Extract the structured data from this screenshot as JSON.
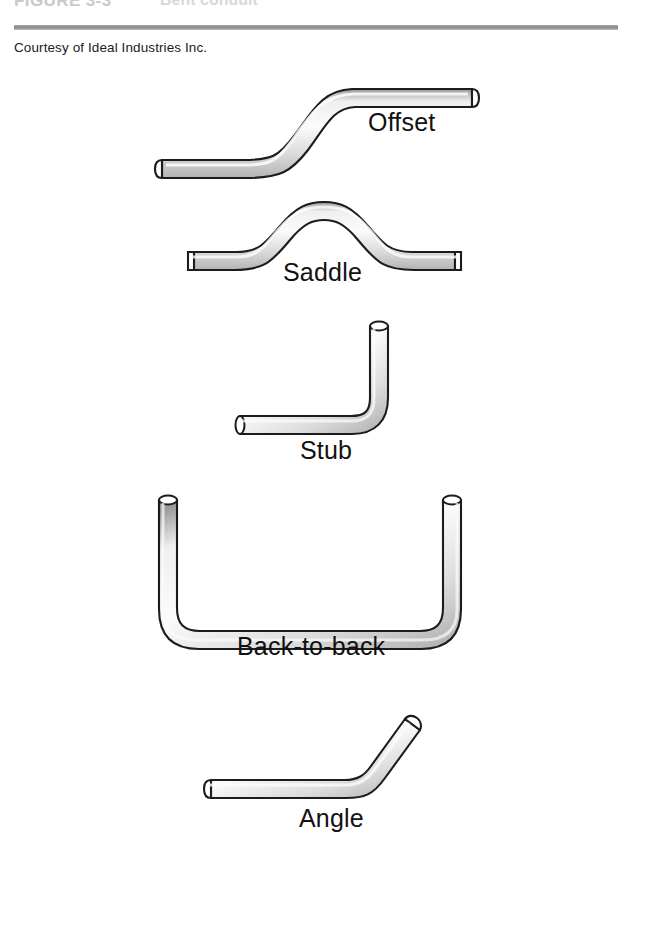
{
  "figure": {
    "title": "FIGURE 3-3",
    "subject": "Bent conduit",
    "credit": "Courtesy of Ideal Industries Inc.",
    "rule_color": "#87878d"
  },
  "style": {
    "tube_fill_light": "#f2f2f2",
    "tube_fill_mid": "#d8d8d8",
    "tube_fill_dark": "#a8a8a8",
    "tube_outline": "#1c1c1c",
    "end_cap_fill": "#ffffff",
    "label_color": "#111111",
    "background": "#ffffff"
  },
  "bends": [
    {
      "id": "offset",
      "label": "Offset",
      "description": "Two opposing bends forming a lateral offset between two parallel runs"
    },
    {
      "id": "saddle",
      "label": "Saddle",
      "description": "Three or four bends forming a hump to pass over an obstruction"
    },
    {
      "id": "stub",
      "label": "Stub",
      "description": "A single ninety degree bend, also called a stub-up"
    },
    {
      "id": "back-to-back",
      "label": "Back-to-back",
      "description": "Two ninety degree bends forming a U shape"
    },
    {
      "id": "angle",
      "label": "Angle",
      "description": "A single bend of less than ninety degrees"
    }
  ]
}
